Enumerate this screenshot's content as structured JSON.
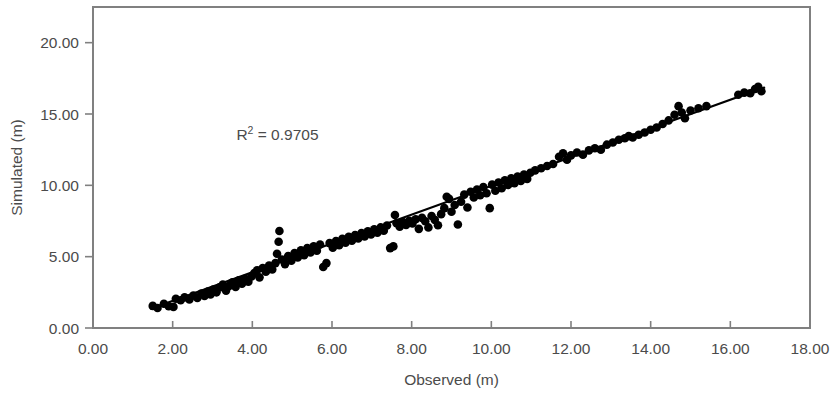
{
  "chart_data": {
    "type": "scatter",
    "title": "",
    "xlabel": "Observed (m)",
    "ylabel": "Simulated (m)",
    "xlim": [
      0,
      18
    ],
    "ylim": [
      0,
      22.5
    ],
    "xticks": [
      0,
      2,
      4,
      6,
      8,
      10,
      12,
      14,
      16,
      18
    ],
    "xtick_labels": [
      "0.00",
      "2.00",
      "4.00",
      "6.00",
      "8.00",
      "10.00",
      "12.00",
      "14.00",
      "16.00",
      "18.00"
    ],
    "yticks": [
      0,
      5,
      10,
      15,
      20
    ],
    "ytick_labels": [
      "0.00",
      "5.00",
      "10.00",
      "15.00",
      "20.00"
    ],
    "grid": false,
    "legend": null,
    "annotations": [
      {
        "name": "r-squared",
        "text_prefix": "R",
        "text_sup": "2",
        "text_suffix": " = 0.9705",
        "value": 0.9705,
        "x": 3.6,
        "y": 13.2
      }
    ],
    "marker": {
      "shape": "circle",
      "color": "#000000",
      "size_px": 8.6
    },
    "trendline": {
      "type": "linear",
      "color": "#000000",
      "x_start": 1.45,
      "y_start": 1.35,
      "x_end": 16.85,
      "y_end": 16.85
    },
    "series": [
      {
        "name": "Observed vs Simulated",
        "points": [
          [
            1.5,
            1.55
          ],
          [
            1.62,
            1.4
          ],
          [
            1.78,
            1.7
          ],
          [
            1.9,
            1.52
          ],
          [
            2.02,
            1.48
          ],
          [
            2.08,
            2.05
          ],
          [
            2.2,
            1.95
          ],
          [
            2.3,
            2.15
          ],
          [
            2.42,
            2.0
          ],
          [
            2.52,
            2.28
          ],
          [
            2.62,
            2.1
          ],
          [
            2.72,
            2.42
          ],
          [
            2.8,
            2.25
          ],
          [
            2.88,
            2.55
          ],
          [
            2.95,
            2.35
          ],
          [
            3.02,
            2.7
          ],
          [
            3.1,
            2.5
          ],
          [
            3.18,
            2.85
          ],
          [
            3.26,
            3.05
          ],
          [
            3.34,
            2.62
          ],
          [
            3.42,
            2.95
          ],
          [
            3.5,
            3.2
          ],
          [
            3.58,
            2.88
          ],
          [
            3.66,
            3.35
          ],
          [
            3.74,
            3.1
          ],
          [
            3.82,
            3.45
          ],
          [
            3.9,
            3.25
          ],
          [
            3.98,
            3.62
          ],
          [
            4.05,
            3.85
          ],
          [
            4.12,
            4.05
          ],
          [
            4.18,
            3.55
          ],
          [
            4.26,
            4.2
          ],
          [
            4.34,
            3.95
          ],
          [
            4.42,
            4.38
          ],
          [
            4.5,
            4.1
          ],
          [
            4.58,
            4.55
          ],
          [
            4.62,
            5.2
          ],
          [
            4.66,
            6.05
          ],
          [
            4.68,
            6.8
          ],
          [
            4.74,
            4.8
          ],
          [
            4.82,
            4.48
          ],
          [
            4.9,
            5.05
          ],
          [
            4.98,
            4.72
          ],
          [
            5.06,
            5.25
          ],
          [
            5.14,
            4.95
          ],
          [
            5.22,
            5.45
          ],
          [
            5.3,
            5.1
          ],
          [
            5.38,
            5.6
          ],
          [
            5.46,
            5.3
          ],
          [
            5.54,
            5.72
          ],
          [
            5.62,
            5.42
          ],
          [
            5.7,
            5.85
          ],
          [
            5.78,
            4.28
          ],
          [
            5.86,
            4.55
          ],
          [
            5.94,
            5.95
          ],
          [
            6.02,
            5.62
          ],
          [
            6.1,
            6.1
          ],
          [
            6.18,
            5.8
          ],
          [
            6.26,
            6.25
          ],
          [
            6.34,
            5.98
          ],
          [
            6.42,
            6.4
          ],
          [
            6.5,
            6.12
          ],
          [
            6.58,
            6.52
          ],
          [
            6.66,
            6.28
          ],
          [
            6.74,
            6.65
          ],
          [
            6.82,
            6.42
          ],
          [
            6.9,
            6.78
          ],
          [
            6.98,
            6.55
          ],
          [
            7.06,
            6.92
          ],
          [
            7.14,
            6.68
          ],
          [
            7.22,
            7.05
          ],
          [
            7.3,
            6.82
          ],
          [
            7.38,
            7.18
          ],
          [
            7.46,
            5.6
          ],
          [
            7.54,
            5.72
          ],
          [
            7.58,
            7.92
          ],
          [
            7.62,
            7.35
          ],
          [
            7.7,
            7.1
          ],
          [
            7.78,
            7.42
          ],
          [
            7.86,
            7.22
          ],
          [
            7.94,
            7.52
          ],
          [
            8.02,
            7.32
          ],
          [
            8.1,
            7.62
          ],
          [
            8.18,
            6.95
          ],
          [
            8.26,
            7.72
          ],
          [
            8.34,
            7.48
          ],
          [
            8.42,
            7.05
          ],
          [
            8.5,
            7.85
          ],
          [
            8.58,
            7.58
          ],
          [
            8.66,
            7.2
          ],
          [
            8.74,
            7.98
          ],
          [
            8.82,
            8.4
          ],
          [
            8.88,
            9.2
          ],
          [
            8.94,
            9.05
          ],
          [
            9.0,
            8.15
          ],
          [
            9.08,
            8.62
          ],
          [
            9.16,
            7.25
          ],
          [
            9.24,
            8.85
          ],
          [
            9.32,
            9.35
          ],
          [
            9.4,
            8.45
          ],
          [
            9.48,
            9.55
          ],
          [
            9.56,
            9.15
          ],
          [
            9.64,
            9.7
          ],
          [
            9.72,
            9.3
          ],
          [
            9.8,
            9.88
          ],
          [
            9.88,
            9.45
          ],
          [
            9.96,
            8.4
          ],
          [
            10.02,
            10.05
          ],
          [
            10.1,
            9.62
          ],
          [
            10.18,
            10.2
          ],
          [
            10.26,
            9.8
          ],
          [
            10.34,
            10.35
          ],
          [
            10.42,
            10.02
          ],
          [
            10.5,
            10.5
          ],
          [
            10.58,
            10.15
          ],
          [
            10.66,
            10.62
          ],
          [
            10.74,
            10.3
          ],
          [
            10.82,
            10.75
          ],
          [
            10.9,
            10.45
          ],
          [
            10.98,
            10.88
          ],
          [
            11.1,
            11.05
          ],
          [
            11.25,
            11.2
          ],
          [
            11.4,
            11.35
          ],
          [
            11.55,
            11.5
          ],
          [
            11.7,
            12.0
          ],
          [
            11.8,
            12.25
          ],
          [
            11.9,
            11.8
          ],
          [
            12.0,
            12.1
          ],
          [
            12.15,
            12.3
          ],
          [
            12.3,
            12.15
          ],
          [
            12.45,
            12.45
          ],
          [
            12.6,
            12.6
          ],
          [
            12.75,
            12.5
          ],
          [
            12.9,
            12.85
          ],
          [
            13.05,
            13.0
          ],
          [
            13.2,
            13.2
          ],
          [
            13.35,
            13.3
          ],
          [
            13.45,
            13.45
          ],
          [
            13.55,
            13.35
          ],
          [
            13.7,
            13.55
          ],
          [
            13.85,
            13.7
          ],
          [
            14.0,
            13.9
          ],
          [
            14.15,
            14.05
          ],
          [
            14.3,
            14.3
          ],
          [
            14.45,
            14.55
          ],
          [
            14.6,
            14.95
          ],
          [
            14.7,
            15.55
          ],
          [
            14.78,
            15.1
          ],
          [
            14.86,
            14.7
          ],
          [
            15.0,
            15.25
          ],
          [
            15.2,
            15.4
          ],
          [
            15.4,
            15.55
          ],
          [
            16.2,
            16.35
          ],
          [
            16.35,
            16.5
          ],
          [
            16.5,
            16.45
          ],
          [
            16.62,
            16.75
          ],
          [
            16.7,
            16.9
          ],
          [
            16.78,
            16.6
          ]
        ]
      }
    ]
  }
}
